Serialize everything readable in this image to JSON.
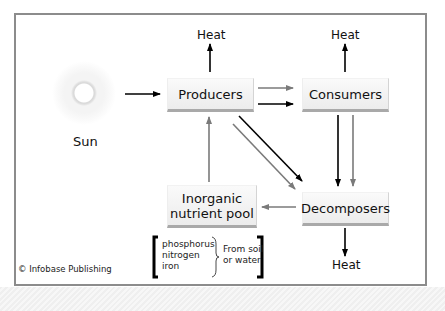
{
  "diagram": {
    "nodes": {
      "sun": "Sun",
      "producers": "Producers",
      "consumers": "Consumers",
      "decomposers": "Decomposers",
      "inorganic_pool_line1": "Inorganic",
      "inorganic_pool_line2": "nutrient pool"
    },
    "heat_labels": {
      "producers": "Heat",
      "consumers": "Heat",
      "decomposers": "Heat"
    },
    "nutrients": [
      "phosphorus",
      "nitrogen",
      "iron"
    ],
    "nutrient_source_line1": "From soil",
    "nutrient_source_line2": "or water",
    "copyright": "© Infobase Publishing",
    "edges": [
      {
        "from": "Sun",
        "to": "Producers",
        "color": "#000000"
      },
      {
        "from": "Producers",
        "to": "Heat",
        "color": "#000000"
      },
      {
        "from": "Consumers",
        "to": "Heat",
        "color": "#000000"
      },
      {
        "from": "Decomposers",
        "to": "Heat",
        "color": "#000000"
      },
      {
        "from": "Producers",
        "to": "Consumers",
        "color": "#7a7a7a",
        "note": "nutrients"
      },
      {
        "from": "Producers",
        "to": "Consumers",
        "color": "#000000",
        "note": "energy"
      },
      {
        "from": "Producers",
        "to": "Decomposers",
        "color": "#000000",
        "note": "energy"
      },
      {
        "from": "Producers",
        "to": "Decomposers",
        "color": "#7a7a7a",
        "note": "nutrients"
      },
      {
        "from": "Consumers",
        "to": "Decomposers",
        "color": "#000000",
        "note": "energy"
      },
      {
        "from": "Consumers",
        "to": "Decomposers",
        "color": "#7a7a7a",
        "note": "nutrients"
      },
      {
        "from": "Decomposers",
        "to": "Inorganic nutrient pool",
        "color": "#7a7a7a"
      },
      {
        "from": "Inorganic nutrient pool",
        "to": "Producers",
        "color": "#7a7a7a"
      }
    ],
    "colors": {
      "energy_arrow": "#000000",
      "nutrient_arrow": "#7a7a7a",
      "frame": "#8c8c8c",
      "box_fill": "#f2f2f2"
    }
  }
}
